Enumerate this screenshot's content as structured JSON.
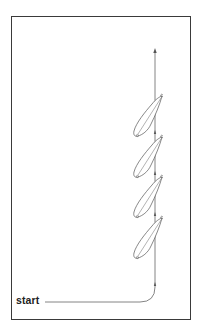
{
  "diagram": {
    "type": "sailing-course-diagram",
    "start_label": "start",
    "colors": {
      "frame": "#3a3a3a",
      "path": "#555555",
      "boat_outline": "#555555",
      "text": "#222222"
    },
    "path": {
      "start": [
        45,
        302
      ],
      "turn_corner": [
        155,
        302
      ],
      "end_arrow": [
        155,
        49
      ]
    },
    "boats": [
      {
        "bow": [
          162,
          96
        ],
        "stern": [
          137,
          136
        ]
      },
      {
        "bow": [
          162,
          137
        ],
        "stern": [
          137,
          177
        ]
      },
      {
        "bow": [
          162,
          177
        ],
        "stern": [
          137,
          217
        ]
      },
      {
        "bow": [
          162,
          218
        ],
        "stern": [
          137,
          258
        ]
      }
    ],
    "path_arrows_y": [
      131,
      172,
      213,
      283
    ]
  }
}
